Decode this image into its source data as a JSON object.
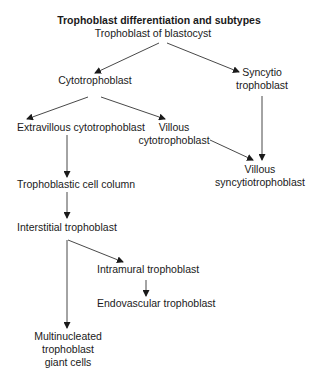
{
  "title": "Trophoblast differentiation and subtypes",
  "nodes": {
    "root": "Trophoblast of blastocyst",
    "cyto": "Cytotrophoblast",
    "syncytio_1": "Syncytio",
    "syncytio_2": "trophoblast",
    "extravillous": "Extravillous cytotrophoblast",
    "villous_cyto_1": "Villous",
    "villous_cyto_2": "cytotrophoblast",
    "villous_syn_1": "Villous",
    "villous_syn_2": "syncytiotrophoblast",
    "cell_column": "Trophoblastic cell column",
    "interstitial": "Interstitial trophoblast",
    "intramural": "Intramural trophoblast",
    "endovascular": "Endovascular trophoblast",
    "giant_1": "Multinucleated",
    "giant_2": "trophoblast",
    "giant_3": "giant cells"
  },
  "edges": [
    {
      "from": "Trophoblast of blastocyst",
      "to": "Cytotrophoblast"
    },
    {
      "from": "Trophoblast of blastocyst",
      "to": "Syncytio trophoblast"
    },
    {
      "from": "Cytotrophoblast",
      "to": "Extravillous cytotrophoblast"
    },
    {
      "from": "Cytotrophoblast",
      "to": "Villous cytotrophoblast"
    },
    {
      "from": "Syncytio trophoblast",
      "to": "Villous syncytiotrophoblast"
    },
    {
      "from": "Villous cytotrophoblast",
      "to": "Villous syncytiotrophoblast"
    },
    {
      "from": "Extravillous cytotrophoblast",
      "to": "Trophoblastic cell column"
    },
    {
      "from": "Trophoblastic cell column",
      "to": "Interstitial trophoblast"
    },
    {
      "from": "Interstitial trophoblast",
      "to": "Intramural trophoblast"
    },
    {
      "from": "Interstitial trophoblast",
      "to": "Multinucleated trophoblast giant cells"
    },
    {
      "from": "Intramural trophoblast",
      "to": "Endovascular trophoblast"
    }
  ]
}
